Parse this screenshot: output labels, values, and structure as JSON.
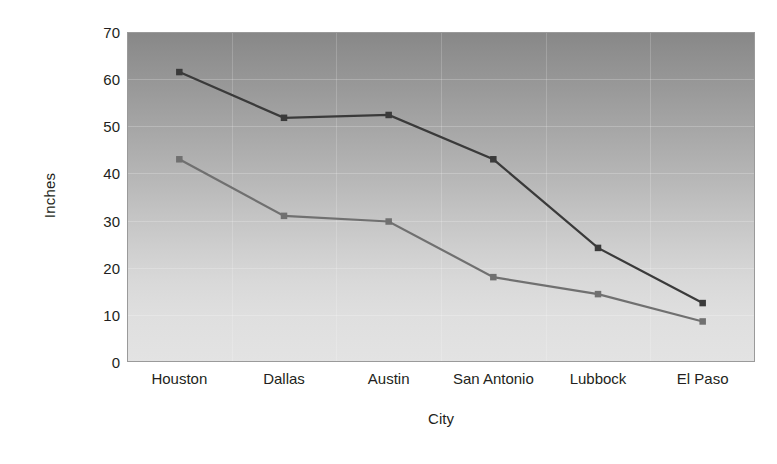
{
  "chart_data": {
    "type": "line",
    "title": "",
    "xlabel": "City",
    "ylabel": "Inches",
    "categories": [
      "Houston",
      "Dallas",
      "Austin",
      "San Antonio",
      "Lubbock",
      "El Paso"
    ],
    "series": [
      {
        "name": "series-1",
        "color": "#3a3a3a",
        "values": [
          61.5,
          51.8,
          52.4,
          43.0,
          24.2,
          12.5
        ]
      },
      {
        "name": "series-2",
        "color": "#707070",
        "values": [
          43.0,
          31.0,
          29.8,
          18.0,
          14.4,
          8.6
        ]
      }
    ],
    "ylim": [
      0,
      70
    ],
    "ytick_values": [
      0,
      10,
      20,
      30,
      40,
      50,
      60,
      70
    ],
    "ytick_labels": [
      "0",
      "10",
      "20",
      "30",
      "40",
      "50",
      "60",
      "70"
    ],
    "grid": true,
    "legend": "none",
    "marker": "square",
    "background": {
      "gradient_top": "#878787",
      "gradient_bottom": "#e3e3e3"
    }
  }
}
